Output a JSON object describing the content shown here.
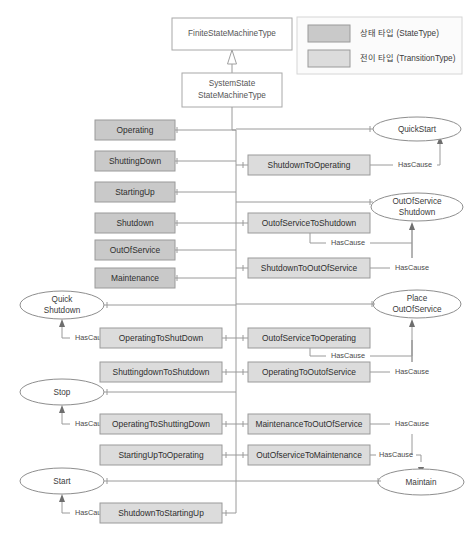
{
  "diagram": {
    "title_boxes": [
      {
        "name": "finite-state-machine-type",
        "label": "FiniteStateMachineType"
      },
      {
        "name": "system-state-state-machine-type",
        "label_line1": "SystemState",
        "label_line2": "StateMachineType"
      }
    ],
    "legend": {
      "items": [
        {
          "swatch": "state",
          "label": "상태 타입 (StateType)",
          "color": "#c9c9c9"
        },
        {
          "swatch": "transition",
          "label": "전이 타입 (TransitionType)",
          "color": "#dcdcdc"
        }
      ]
    },
    "states": [
      {
        "id": "operating",
        "label": "Operating"
      },
      {
        "id": "shuttingdown",
        "label": "ShuttingDown"
      },
      {
        "id": "startingup",
        "label": "StartingUp"
      },
      {
        "id": "shutdown",
        "label": "Shutdown"
      },
      {
        "id": "outofservice",
        "label": "OutOfService"
      },
      {
        "id": "maintenance",
        "label": "Maintenance"
      }
    ],
    "transitions_right": [
      {
        "id": "shutdown-to-operating",
        "label": "ShutdownToOperating"
      },
      {
        "id": "outofservice-to-shutdown",
        "label": "OutofServiceToShutdown"
      },
      {
        "id": "shutdown-to-outofservice",
        "label": "ShutdownToOutOfService"
      },
      {
        "id": "outofservice-to-operating",
        "label": "OutofServiceToOperating"
      },
      {
        "id": "operating-to-outofservice",
        "label": "OperatingToOutofService"
      },
      {
        "id": "maintenance-to-outofservice",
        "label": "MaintenanceToOutOfService"
      },
      {
        "id": "outofservice-to-maintenance",
        "label": "OutOfserviceToMaintenance"
      }
    ],
    "transitions_left": [
      {
        "id": "operating-to-shutdown",
        "label": "OperatingToShutDown"
      },
      {
        "id": "shuttingdown-to-shutdown",
        "label": "ShuttingdownToShutdown"
      },
      {
        "id": "operating-to-shuttingdown",
        "label": "OperatingToShuttingDown"
      },
      {
        "id": "startingup-to-operating",
        "label": "StartingUpToOperating"
      },
      {
        "id": "shutdown-to-startingup",
        "label": "ShutdownToStartingUp"
      }
    ],
    "causes_right": [
      {
        "id": "quickstart",
        "label": "QuickStart",
        "line1": "QuickStart",
        "line2": ""
      },
      {
        "id": "outofservice-shutdown",
        "label": "OutOfServiceShutdown",
        "line1": "OutOfService",
        "line2": "Shutdown"
      },
      {
        "id": "place-outofservice",
        "label": "PlaceOutOfService",
        "line1": "Place",
        "line2": "OutOfService"
      },
      {
        "id": "maintain",
        "label": "Maintain",
        "line1": "Maintain",
        "line2": ""
      }
    ],
    "causes_left": [
      {
        "id": "quick-shutdown",
        "label": "QuickShutdown",
        "line1": "Quick",
        "line2": "Shutdown"
      },
      {
        "id": "stop",
        "label": "Stop",
        "line1": "Stop",
        "line2": ""
      },
      {
        "id": "start",
        "label": "Start",
        "line1": "Start",
        "line2": ""
      }
    ],
    "relation_label": "HasCause",
    "has_cause_labels": [
      {
        "id": "hascause-shutdown-to-operating",
        "label": "HasCause"
      },
      {
        "id": "hascause-outofservice-to-shutdown",
        "label": "HasCause"
      },
      {
        "id": "hascause-shutdown-to-outofservice",
        "label": "HasCause"
      },
      {
        "id": "hascause-outofservice-to-operating",
        "label": "HasCause"
      },
      {
        "id": "hascause-operating-to-outofservice",
        "label": "HasCause"
      },
      {
        "id": "hascause-maintenance-to-outofservice",
        "label": "HasCause"
      },
      {
        "id": "hascause-outofservice-to-maintenance",
        "label": "HasCause"
      },
      {
        "id": "hascause-operating-to-shutdown",
        "label": "HasCause"
      },
      {
        "id": "hascause-operating-to-shuttingdown",
        "label": "HasCause"
      },
      {
        "id": "hascause-shutdown-to-startingup",
        "label": "HasCause"
      }
    ]
  }
}
